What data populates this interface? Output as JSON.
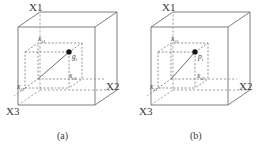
{
  "figure": {
    "panels": [
      {
        "id": "a",
        "caption": "(a)",
        "axes": {
          "x1": "X1",
          "x2": "X2",
          "x3": "X3"
        },
        "point_label": "g",
        "point_subscript": "i",
        "coord_labels": [
          {
            "base": "x",
            "sub": "i1"
          },
          {
            "base": "x",
            "sub": "i2"
          },
          {
            "base": "x",
            "sub": "i3"
          }
        ]
      },
      {
        "id": "b",
        "caption": "(b)",
        "axes": {
          "x1": "X1",
          "x2": "X2",
          "x3": "X3"
        },
        "point_label": "p",
        "point_subscript": "i",
        "coord_labels": [
          {
            "base": "x",
            "sub": "i1"
          },
          {
            "base": "x",
            "sub": "i2"
          },
          {
            "base": "x",
            "sub": "i3"
          }
        ]
      }
    ],
    "colors": {
      "edge": "#6f6f6f",
      "dashed": "#8a8a8a",
      "point": "#151515",
      "text": "#3a3a3a",
      "background": "#ffffff"
    }
  }
}
